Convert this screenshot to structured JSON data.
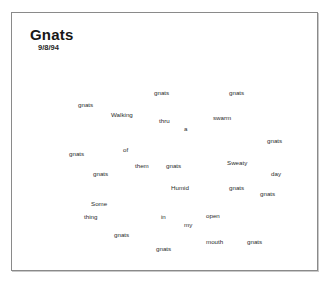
{
  "document": {
    "title": "Gnats",
    "date": "9/8/94"
  },
  "poem": {
    "reading_order_text": "Walking thru a swarm of them Sweaty Humid day Some thing in my open mouth gnats",
    "words": [
      {
        "text": "gnats",
        "x": 153,
        "y": 89,
        "rot": 0
      },
      {
        "text": "gnats",
        "x": 228,
        "y": 89,
        "rot": 0
      },
      {
        "text": "gnats",
        "x": 77,
        "y": 101,
        "rot": 0
      },
      {
        "text": "Walking",
        "x": 110,
        "y": 111,
        "rot": 0
      },
      {
        "text": "thru",
        "x": 158,
        "y": 117,
        "rot": 0
      },
      {
        "text": "swarm",
        "x": 212,
        "y": 114,
        "rot": 0
      },
      {
        "text": "a",
        "x": 183,
        "y": 125,
        "rot": 0
      },
      {
        "text": "gnats",
        "x": 266,
        "y": 137,
        "rot": 0
      },
      {
        "text": "of",
        "x": 122,
        "y": 146,
        "rot": 0
      },
      {
        "text": "gnats",
        "x": 68,
        "y": 150,
        "rot": 0
      },
      {
        "text": "them",
        "x": 134,
        "y": 162,
        "rot": 0
      },
      {
        "text": "gnats",
        "x": 165,
        "y": 162,
        "rot": 0
      },
      {
        "text": "Sweaty",
        "x": 226,
        "y": 159,
        "rot": 0
      },
      {
        "text": "gnats",
        "x": 92,
        "y": 170,
        "rot": 0
      },
      {
        "text": "day",
        "x": 270,
        "y": 170,
        "rot": 0
      },
      {
        "text": "Humid",
        "x": 170,
        "y": 184,
        "rot": 0
      },
      {
        "text": "gnats",
        "x": 228,
        "y": 184,
        "rot": 0
      },
      {
        "text": "gnats",
        "x": 259,
        "y": 190,
        "rot": 0
      },
      {
        "text": "Some",
        "x": 90,
        "y": 200,
        "rot": 0
      },
      {
        "text": "thing",
        "x": 83,
        "y": 213,
        "rot": 0
      },
      {
        "text": "in",
        "x": 160,
        "y": 213,
        "rot": 0
      },
      {
        "text": "open",
        "x": 205,
        "y": 212,
        "rot": 0
      },
      {
        "text": "my",
        "x": 183,
        "y": 221,
        "rot": 0
      },
      {
        "text": "gnats",
        "x": 113,
        "y": 231,
        "rot": 0
      },
      {
        "text": "mouth",
        "x": 205,
        "y": 238,
        "rot": 0
      },
      {
        "text": "gnats",
        "x": 246,
        "y": 238,
        "rot": 0
      },
      {
        "text": "gnats",
        "x": 155,
        "y": 245,
        "rot": 0
      }
    ]
  },
  "colors": {
    "page_background": "#ffffff",
    "frame_border": "#8a8a8a",
    "title_text": "#171717",
    "word_text": "#2b2b2b"
  }
}
